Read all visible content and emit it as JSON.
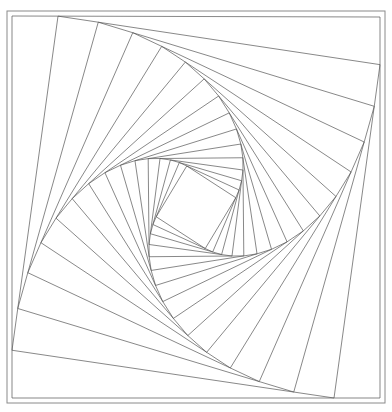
{
  "figure": {
    "kind": "geometric-line-drawing",
    "canvas": {
      "width": 392,
      "height": 412
    },
    "background_color": "#ffffff",
    "line_color": "#555555",
    "frame_color": "#8a8a8a",
    "line_width": 0.7,
    "frame_width": 1.0
  },
  "chart_data": {
    "type": "line",
    "xlabel": "",
    "ylabel": "",
    "grid": false,
    "legend": null,
    "xlim": [
      0,
      392
    ],
    "ylim": [
      0,
      412
    ],
    "construction": {
      "outer_square": [
        [
          12,
          16
        ],
        [
          380,
          17
        ],
        [
          380,
          398
        ],
        [
          12,
          398
        ]
      ],
      "step_ratio": 0.125,
      "direction": "counterclockwise",
      "iterations": 16
    },
    "outer_frame": {
      "x": 7,
      "y": 11,
      "width": 378,
      "height": 392
    },
    "measured_edge_vertices": {
      "top_edge_x": [
        58,
        105,
        143,
        177
      ],
      "right_edge_y": [
        63,
        109,
        150
      ],
      "bottom_edge_x": [
        337,
        293,
        253
      ],
      "left_edge_y": [
        353,
        308,
        263
      ]
    },
    "inner_square_estimate": [
      [
        146,
        187
      ],
      [
        220,
        152
      ],
      [
        248,
        228
      ],
      [
        177,
        260
      ]
    ]
  }
}
